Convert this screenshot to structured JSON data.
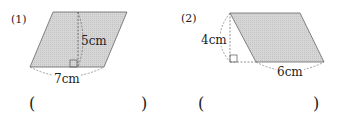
{
  "problems": [
    {
      "number": "(1)",
      "height_label": "5cm",
      "base_label": "7cm",
      "answer_open": "(",
      "answer_close": ")"
    },
    {
      "number": "(2)",
      "height_label": "4cm",
      "base_label": "6cm",
      "answer_open": "(",
      "answer_close": ")"
    }
  ],
  "colors": {
    "fill": "#d4d4d4",
    "stroke": "#555555"
  }
}
